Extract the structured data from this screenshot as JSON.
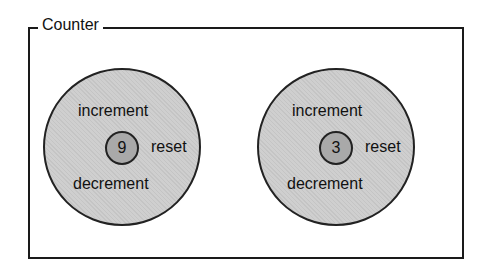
{
  "group": {
    "title": "Counter"
  },
  "counters": [
    {
      "value": "9",
      "increment_label": "increment",
      "decrement_label": "decrement",
      "reset_label": "reset"
    },
    {
      "value": "3",
      "increment_label": "increment",
      "decrement_label": "decrement",
      "reset_label": "reset"
    }
  ],
  "colors": {
    "outer_fill": "#cfcfcf",
    "inner_fill": "#a9a9a9",
    "stroke": "#222222"
  }
}
